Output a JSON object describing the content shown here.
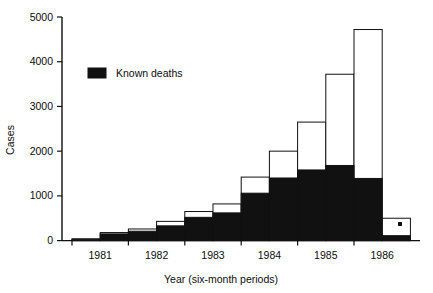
{
  "chart_data": {
    "type": "bar",
    "subtype": "stacked-vertical",
    "title": "",
    "xlabel": "Year (six-month periods)",
    "ylabel": "Cases",
    "ylim": [
      0,
      5000
    ],
    "ytick_values": [
      0,
      1000,
      2000,
      3000,
      4000,
      5000
    ],
    "ytick_labels": [
      "0",
      "1000",
      "2000",
      "3000",
      "4000",
      "5000"
    ],
    "xtick_labels": [
      "1981",
      "1982",
      "1983",
      "1984",
      "1985",
      "1986"
    ],
    "grid": false,
    "legend_position": "upper-left-inside",
    "series": [
      {
        "name": "Known deaths",
        "color": "#111111",
        "values": [
          30,
          150,
          210,
          330,
          520,
          620,
          1060,
          1400,
          1580,
          1680,
          1390,
          110
        ]
      },
      {
        "name": "Total cases",
        "color": "#ffffff",
        "values": [
          40,
          180,
          260,
          430,
          650,
          820,
          1420,
          2000,
          2650,
          3720,
          4720,
          500
        ]
      }
    ],
    "categories": [
      "1981 H1",
      "1981 H2",
      "1982 H1",
      "1982 H2",
      "1983 H1",
      "1983 H2",
      "1984 H1",
      "1984 H2",
      "1985 H1",
      "1985 H2",
      "1986 H1",
      "1986 H2"
    ],
    "annotations": [
      {
        "text": "*",
        "near": "final-bar",
        "meaning": "incomplete-period-marker"
      }
    ]
  },
  "legend": {
    "entries": [
      {
        "label": "Known deaths",
        "swatch": "#111111"
      }
    ]
  },
  "axes": {
    "y_title": "Cases",
    "x_title": "Year (six-month periods)"
  },
  "icons": {
    "legend_swatch": "filled-square-icon",
    "footnote_marker": "asterisk-icon"
  }
}
